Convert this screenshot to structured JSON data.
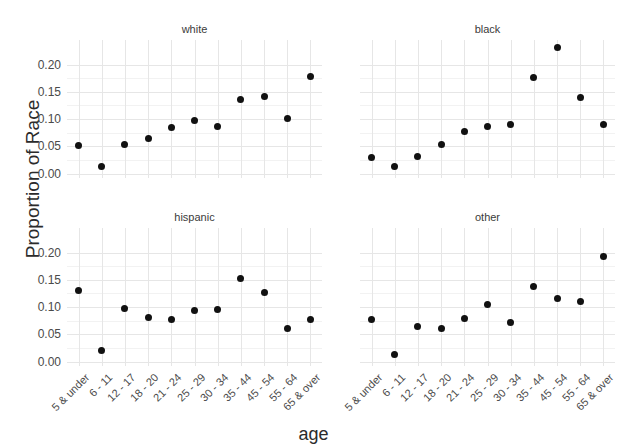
{
  "chart_data": {
    "type": "scatter",
    "title": "",
    "xlabel": "age",
    "ylabel": "Proportion of Race",
    "ylim": [
      -0.008,
      0.245
    ],
    "yticks": [
      0.0,
      0.05,
      0.1,
      0.15,
      0.2
    ],
    "ytick_labels": [
      "0.00",
      "0.05",
      "0.10",
      "0.15",
      "0.20"
    ],
    "grid": true,
    "legend": "none",
    "facet_layout": "2x2",
    "categories": [
      "5 & under",
      "6 - 11",
      "12 - 17",
      "18 - 20",
      "21 - 24",
      "25 - 29",
      "30 - 34",
      "35 - 44",
      "45 - 54",
      "55 - 64",
      "65 & over"
    ],
    "panels": [
      {
        "name": "white",
        "values": [
          0.051,
          0.014,
          0.053,
          0.065,
          0.084,
          0.098,
          0.087,
          0.136,
          0.141,
          0.102,
          0.178
        ]
      },
      {
        "name": "black",
        "values": [
          0.029,
          0.014,
          0.032,
          0.054,
          0.078,
          0.086,
          0.091,
          0.177,
          0.232,
          0.139,
          0.091
        ]
      },
      {
        "name": "hispanic",
        "values": [
          0.131,
          0.021,
          0.097,
          0.081,
          0.078,
          0.094,
          0.095,
          0.153,
          0.126,
          0.06,
          0.077
        ]
      },
      {
        "name": "other",
        "values": [
          0.078,
          0.014,
          0.065,
          0.061,
          0.08,
          0.105,
          0.072,
          0.137,
          0.115,
          0.11,
          0.193
        ]
      }
    ]
  },
  "axis": {
    "y_title": "Proportion of Race",
    "x_title": "age"
  },
  "panel_titles": {
    "top_left": "white",
    "top_right": "black",
    "bottom_left": "hispanic",
    "bottom_right": "other"
  },
  "colors": {
    "point": "#111111",
    "grid_major": "#e6e6e6",
    "grid_minor": "#f2f2f2",
    "background": "#ffffff",
    "text": "#3a3a3a"
  }
}
